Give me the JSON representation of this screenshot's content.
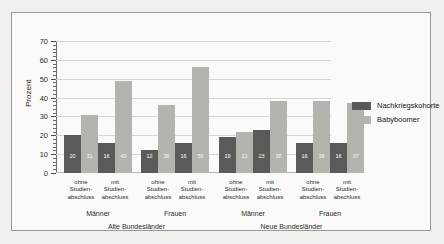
{
  "chart_data": {
    "type": "bar",
    "title": "",
    "subtitle": "",
    "xlabel": "",
    "ylabel": "Prozent",
    "ylim": [
      0,
      70
    ],
    "ytick_step": 10,
    "yticks": [
      0,
      10,
      20,
      30,
      40,
      50,
      60,
      70
    ],
    "grid": true,
    "legend_position": "right",
    "series": [
      {
        "name": "Nachkriegskohorte",
        "color": "#5c5a58",
        "values": [
          20,
          16,
          12,
          16,
          19,
          23,
          16,
          16
        ]
      },
      {
        "name": "Babyboomer",
        "color": "#b5b3ae",
        "values": [
          31,
          49,
          36,
          56,
          22,
          38,
          38,
          37
        ]
      }
    ],
    "categories": [
      "ohne Studienabschluss",
      "mit Studienabschluss",
      "ohne Studienabschluss",
      "mit Studienabschluss",
      "ohne Studienabschluss",
      "mit Studienabschluss",
      "ohne Studienabschluss",
      "mit Studienabschluss"
    ],
    "category_lines": [
      [
        "ohne",
        "Studien-",
        "abschluss"
      ],
      [
        "mit",
        "Studien-",
        "abschluss"
      ],
      [
        "ohne",
        "Studien-",
        "abschluss"
      ],
      [
        "mit",
        "Studien-",
        "abschluss"
      ],
      [
        "ohne",
        "Studien-",
        "abschluss"
      ],
      [
        "mit",
        "Studien-",
        "abschluss"
      ],
      [
        "ohne",
        "Studien-",
        "abschluss"
      ],
      [
        "mit",
        "Studien-",
        "abschluss"
      ]
    ],
    "group_labels": [
      "Männer",
      "Frauen",
      "Männer",
      "Frauen"
    ],
    "region_labels": [
      "Alte Bundesländer",
      "Neue Bundesländer"
    ]
  },
  "axis": {
    "y_title": "Prozent",
    "y_tick_labels": [
      "70",
      "60",
      "50",
      "40",
      "30",
      "20",
      "10",
      "0"
    ]
  },
  "legend": {
    "items": [
      {
        "label": "Nachkriegskohorte",
        "color": "#5c5a58"
      },
      {
        "label": "Babyboomer",
        "color": "#b5b3ae"
      }
    ]
  },
  "bar_labels": {
    "g1": [
      "20",
      "31",
      "16",
      "49"
    ],
    "g2": [
      "12",
      "36",
      "16",
      "56"
    ],
    "g3": [
      "19",
      "22",
      "23",
      "38"
    ],
    "g4": [
      "16",
      "38",
      "16",
      "37"
    ]
  },
  "groups": {
    "labels": [
      "Männer",
      "Frauen",
      "Männer",
      "Frauen"
    ]
  },
  "regions": {
    "labels": [
      "Alte Bundesländer",
      "Neue Bundesländer"
    ]
  },
  "categories_text": {
    "c0_l0": "ohne",
    "c0_l1": "Studien-",
    "c0_l2": "abschluss",
    "c1_l0": "mit",
    "c1_l1": "Studien-",
    "c1_l2": "abschluss",
    "c2_l0": "ohne",
    "c2_l1": "Studien-",
    "c2_l2": "abschluss",
    "c3_l0": "mit",
    "c3_l1": "Studien-",
    "c3_l2": "abschluss",
    "c4_l0": "ohne",
    "c4_l1": "Studien-",
    "c4_l2": "abschluss",
    "c5_l0": "mit",
    "c5_l1": "Studien-",
    "c5_l2": "abschluss",
    "c6_l0": "ohne",
    "c6_l1": "Studien-",
    "c6_l2": "abschluss",
    "c7_l0": "mit",
    "c7_l1": "Studien-",
    "c7_l2": "abschluss"
  }
}
